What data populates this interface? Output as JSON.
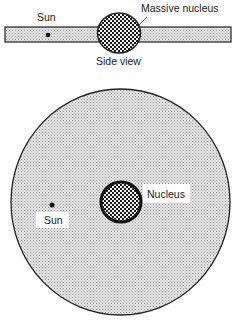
{
  "side_view": {
    "caption": "Side view",
    "labels": {
      "sun": "Sun",
      "nucleus": "Massive nucleus"
    }
  },
  "top_view": {
    "labels": {
      "sun": "Sun",
      "nucleus": "Nucleus"
    }
  },
  "colors": {
    "outline": "#222222",
    "disk_fill": "#d9d9d9",
    "nucleus_fill": "#4a4a4a",
    "label_bg": "#ffffff"
  }
}
